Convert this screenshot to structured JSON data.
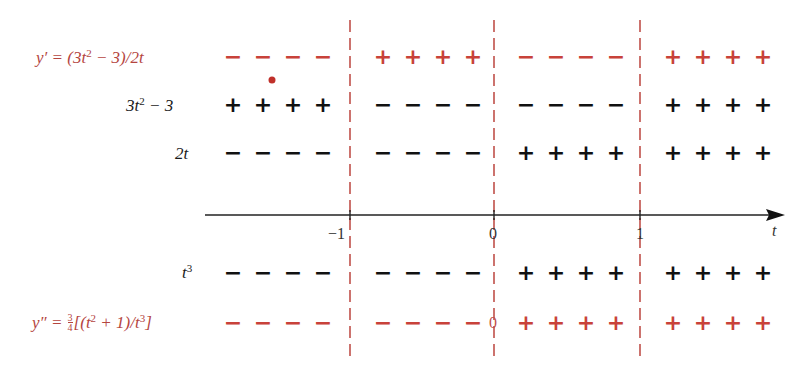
{
  "diagram": {
    "type": "sign-chart",
    "variable": "t",
    "critical_points": [
      "-1",
      "0",
      "1"
    ],
    "axis_label": "t",
    "colors": {
      "derivative_rows": "#c8423a",
      "factor_rows": "#111111",
      "divider_lines": "#c0504a",
      "axis": "#222222"
    },
    "rows": [
      {
        "id": "y-prime",
        "label": "y′ = (3t² − 3)/2t",
        "color": "red",
        "signs": [
          "−",
          "+",
          "−",
          "+"
        ]
      },
      {
        "id": "3t2-minus-3",
        "label": "3t² − 3",
        "color": "black",
        "signs": [
          "+",
          "−",
          "−",
          "+"
        ]
      },
      {
        "id": "2t",
        "label": "2t",
        "color": "black",
        "signs": [
          "−",
          "−",
          "+",
          "+"
        ]
      },
      {
        "id": "t3",
        "label": "t³",
        "color": "black",
        "signs": [
          "−",
          "−",
          "+",
          "+"
        ]
      },
      {
        "id": "y-double-prime",
        "label": "y″ = ¾[(t² + 1)/t³]",
        "color": "red",
        "signs": [
          "−",
          "−",
          "+",
          "+"
        ],
        "marker_at_zero": "0"
      }
    ],
    "tick_labels": {
      "minus_one": "−1",
      "zero": "0",
      "one": "1",
      "axis_var": "t"
    },
    "label_text": {
      "y_prime_prefix": "y′ = (3t",
      "y_prime_suffix": " − 3)/2t",
      "sq": "2",
      "cube": "3",
      "row2_a": "3t",
      "row2_b": " − 3",
      "row3": "2t",
      "row4": "t",
      "ypp_prefix": "y″ = ",
      "frac_num": "3",
      "frac_den": "4",
      "ypp_mid1": "[(t",
      "ypp_mid2": " + 1)/t",
      "ypp_end": "]",
      "zero_marker": "0"
    }
  }
}
